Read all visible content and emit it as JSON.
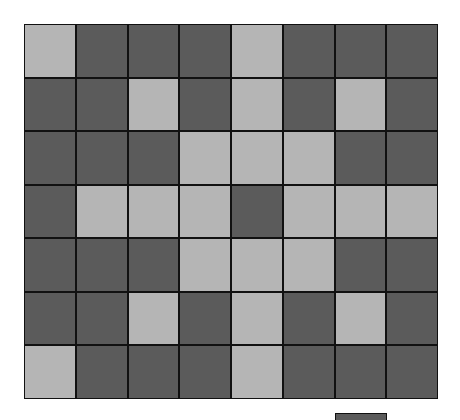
{
  "game": {
    "type": "grid-toggle-puzzle",
    "rows": 7,
    "cols": 8,
    "colors": {
      "light": "#b5b5b5",
      "dark": "#5b5b5b",
      "border": "#111111",
      "background": "#ffffff"
    },
    "grid": [
      [
        "L",
        "D",
        "D",
        "D",
        "L",
        "D",
        "D",
        "D"
      ],
      [
        "D",
        "D",
        "L",
        "D",
        "L",
        "D",
        "L",
        "D"
      ],
      [
        "D",
        "D",
        "D",
        "L",
        "L",
        "L",
        "D",
        "D"
      ],
      [
        "D",
        "L",
        "L",
        "L",
        "D",
        "L",
        "L",
        "L"
      ],
      [
        "D",
        "D",
        "D",
        "L",
        "L",
        "L",
        "D",
        "D"
      ],
      [
        "D",
        "D",
        "L",
        "D",
        "L",
        "D",
        "L",
        "D"
      ],
      [
        "L",
        "D",
        "D",
        "D",
        "L",
        "D",
        "D",
        "D"
      ]
    ],
    "indicator": {
      "state": "D"
    }
  }
}
